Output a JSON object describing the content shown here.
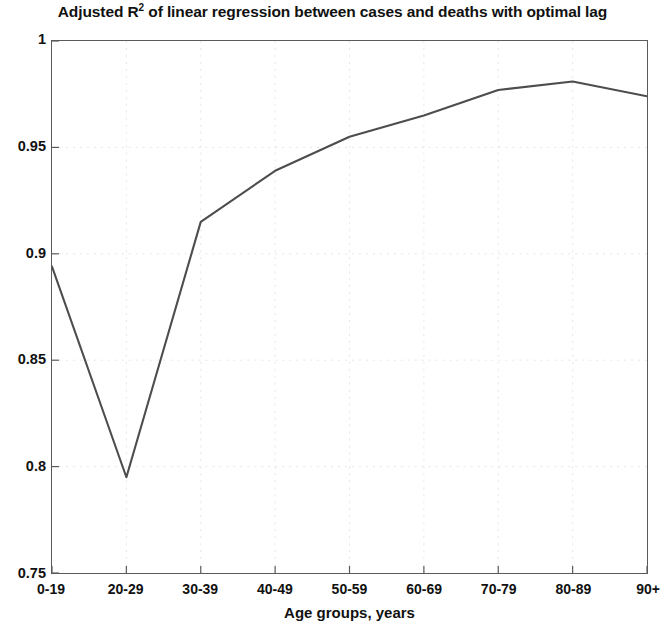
{
  "chart_data": {
    "type": "line",
    "title_prefix": "Adjusted R",
    "title_superscript": "2",
    "title_suffix": " of linear regression between cases and deaths with optimal lag",
    "xlabel": "Age groups, years",
    "ylabel": "",
    "categories": [
      "0-19",
      "20-29",
      "30-39",
      "40-49",
      "50-59",
      "60-69",
      "70-79",
      "80-89",
      "90+"
    ],
    "values": [
      0.894,
      0.795,
      0.915,
      0.939,
      0.955,
      0.965,
      0.977,
      0.981,
      0.974
    ],
    "series": [
      {
        "name": "Adjusted R2",
        "values": [
          0.894,
          0.795,
          0.915,
          0.939,
          0.955,
          0.965,
          0.977,
          0.981,
          0.974
        ]
      }
    ],
    "ylim": [
      0.75,
      1
    ],
    "xlim": [
      0,
      8
    ],
    "ytick_labels": [
      "1",
      "0.95",
      "0.9",
      "0.85",
      "0.8",
      "0.75"
    ],
    "ytick_values": [
      1,
      0.95,
      0.9,
      0.85,
      0.8,
      0.75
    ],
    "xtick_labels": [
      "0-19",
      "20-29",
      "30-39",
      "40-49",
      "50-59",
      "60-69",
      "70-79",
      "80-89",
      "90+"
    ],
    "grid": true,
    "legend": "none",
    "line_color": "#4d4d4d",
    "axis_color": "#5a5a5a",
    "grid_color": "#dfdfdf",
    "annotations": []
  },
  "axes": {
    "x_axis_title": "Age groups, years"
  }
}
